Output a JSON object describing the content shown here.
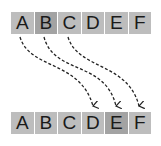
{
  "diagram": {
    "top_row": [
      {
        "label": "A",
        "shade": "#bdbdbd"
      },
      {
        "label": "B",
        "shade": "#a3a3a3"
      },
      {
        "label": "C",
        "shade": "#bdbdbd"
      },
      {
        "label": "D",
        "shade": "#bdbdbd"
      },
      {
        "label": "E",
        "shade": "#bdbdbd"
      },
      {
        "label": "F",
        "shade": "#bdbdbd"
      }
    ],
    "bottom_row": [
      {
        "label": "A",
        "shade": "#bdbdbd"
      },
      {
        "label": "B",
        "shade": "#bdbdbd"
      },
      {
        "label": "C",
        "shade": "#bdbdbd"
      },
      {
        "label": "D",
        "shade": "#bdbdbd"
      },
      {
        "label": "E",
        "shade": "#a3a3a3"
      },
      {
        "label": "F",
        "shade": "#bdbdbd"
      }
    ],
    "arrows": [
      {
        "from": "A",
        "to": "D",
        "style": "dashed"
      },
      {
        "from": "B",
        "to": "E",
        "style": "dashed"
      },
      {
        "from": "C",
        "to": "F",
        "style": "dashed"
      }
    ]
  }
}
